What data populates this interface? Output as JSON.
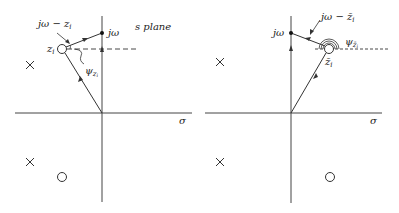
{
  "figure": {
    "left_panel": {
      "labels": {
        "vector": "jω − z",
        "vector_sub": "i",
        "jw": "jω",
        "plane": "s plane",
        "zero": "z",
        "zero_sub": "i",
        "angle": "ψ",
        "angle_sub": "z",
        "angle_subsub": "i",
        "sigma": "σ"
      },
      "markers": {
        "poles": [
          {
            "x": 30,
            "y": 65
          },
          {
            "x": 30,
            "y": 162
          }
        ],
        "zeros": [
          {
            "x": 62,
            "y": 49
          },
          {
            "x": 62,
            "y": 177
          }
        ]
      }
    },
    "right_panel": {
      "labels": {
        "vector": "jω − z̄",
        "vector_sub": "i",
        "jw": "jω",
        "zero": "z̄",
        "zero_sub": "i",
        "angle": "ψ",
        "angle_sub": "z̄",
        "angle_subsub": "i",
        "sigma": "σ"
      },
      "markers": {
        "poles": [
          {
            "x": 220,
            "y": 62
          },
          {
            "x": 220,
            "y": 162
          }
        ],
        "zeros": [
          {
            "x": 329,
            "y": 49
          },
          {
            "x": 330,
            "y": 177
          }
        ]
      }
    },
    "colors": {
      "line": "#333333",
      "text": "#222222"
    }
  }
}
